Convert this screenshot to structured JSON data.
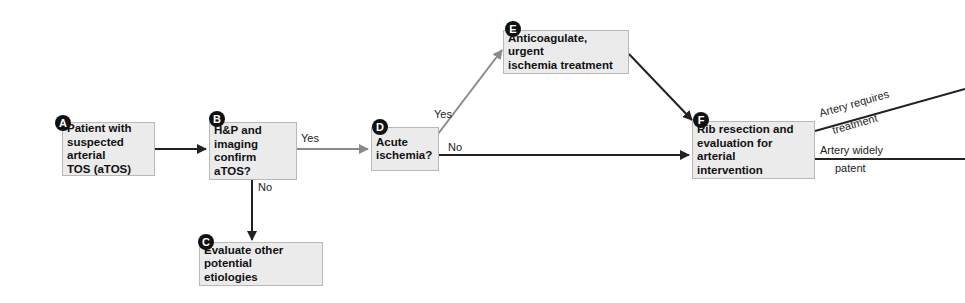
{
  "diagram": {
    "type": "clinical-decision-flowchart",
    "nodes": [
      {
        "id": "A",
        "badge": "A",
        "label": "Patient with suspected arterial TOS (aTOS)"
      },
      {
        "id": "B",
        "badge": "B",
        "label": "H&P and imaging confirm aTOS?"
      },
      {
        "id": "C",
        "badge": "C",
        "label": "Evaluate other potential etiologies"
      },
      {
        "id": "D",
        "badge": "D",
        "label": "Acute ischemia?"
      },
      {
        "id": "E",
        "badge": "E",
        "label": "Anticoagulate, urgent ischemia treatment"
      },
      {
        "id": "F",
        "badge": "F",
        "label": "Rib resection and evaluation for arterial intervention"
      }
    ],
    "edges": [
      {
        "from": "A",
        "to": "B",
        "label": ""
      },
      {
        "from": "B",
        "to": "D",
        "label": "Yes"
      },
      {
        "from": "B",
        "to": "C",
        "label": "No"
      },
      {
        "from": "D",
        "to": "E",
        "label": "Yes"
      },
      {
        "from": "D",
        "to": "F",
        "label": "No"
      },
      {
        "from": "E",
        "to": "F",
        "label": ""
      },
      {
        "from": "F",
        "to": "offscreen-upper",
        "label": "Artery requires treatment"
      },
      {
        "from": "F",
        "to": "offscreen-lower",
        "label": "Artery widely patent"
      }
    ],
    "edge_labels": {
      "b_yes": "Yes",
      "b_no": "No",
      "d_yes": "Yes",
      "d_no": "No",
      "f_upper_1": "Artery requires",
      "f_upper_2": "treatment",
      "f_lower_1": "Artery widely",
      "f_lower_2": "patent"
    },
    "colors": {
      "box_fill": "#ebebeb",
      "box_border": "#b8b8b8",
      "yes_arrow": "#8a8a8a",
      "primary_arrow": "#222222",
      "badge": "#111111"
    }
  },
  "text": {
    "A_l1": "Patient with",
    "A_l2": "suspected arterial",
    "A_l3": "TOS (aTOS)",
    "B_l1": "H&P and",
    "B_l2": "imaging",
    "B_l3": "confirm aTOS?",
    "C_l1": "Evaluate other potential",
    "C_l2": "etiologies",
    "D_l1": "Acute",
    "D_l2": "ischemia?",
    "E_l1": "Anticoagulate, urgent",
    "E_l2": "ischemia treatment",
    "F_l1": "Rib resection and",
    "F_l2": "evaluation for arterial",
    "F_l3": "intervention"
  }
}
